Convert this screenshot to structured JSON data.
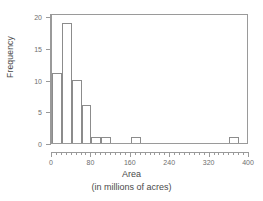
{
  "chart_data": {
    "type": "bar",
    "title": "",
    "xlabel": "Area",
    "xlabel_sub": "(in millions of acres)",
    "ylabel": "Frequency",
    "xlim": [
      0,
      400
    ],
    "ylim": [
      0,
      20.5
    ],
    "grid": false,
    "legend": null,
    "bin_width": 20,
    "x_major_ticks": [
      0,
      80,
      160,
      240,
      320,
      400
    ],
    "x_major_tick_labels": [
      "0",
      "80",
      "160",
      "240",
      "320",
      "400"
    ],
    "x_minor_tick_step": 10,
    "y_ticks": [
      0,
      5,
      10,
      15,
      20
    ],
    "y_tick_labels": [
      "0",
      "5",
      "10",
      "15",
      "20"
    ],
    "bins": [
      {
        "start": 0,
        "end": 20,
        "count": 11
      },
      {
        "start": 20,
        "end": 40,
        "count": 19
      },
      {
        "start": 40,
        "end": 60,
        "count": 10
      },
      {
        "start": 60,
        "end": 80,
        "count": 6
      },
      {
        "start": 80,
        "end": 100,
        "count": 1
      },
      {
        "start": 100,
        "end": 120,
        "count": 1
      },
      {
        "start": 160,
        "end": 180,
        "count": 1
      },
      {
        "start": 360,
        "end": 380,
        "count": 1
      }
    ],
    "categories": [
      "0-20",
      "20-40",
      "40-60",
      "60-80",
      "80-100",
      "100-120",
      "160-180",
      "360-380"
    ],
    "values": [
      11,
      19,
      10,
      6,
      1,
      1,
      1,
      1
    ],
    "colors": {
      "background": "#ffffff",
      "bar_face": "#ffffff",
      "bar_edge": "#8c8c8c",
      "axis": "#9a9a9a",
      "tick_label": "#6e6e6e",
      "axis_title": "#4a4a4a"
    }
  }
}
